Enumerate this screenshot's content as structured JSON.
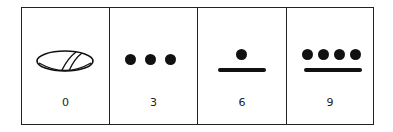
{
  "cells": [
    {
      "value": "0",
      "glyph": "shell-icon"
    },
    {
      "value": "3",
      "glyph": "three-dots",
      "dots": 3,
      "bars": 0
    },
    {
      "value": "6",
      "glyph": "one-dot-one-bar",
      "dots": 1,
      "bars": 1
    },
    {
      "value": "9",
      "glyph": "four-dots-one-bar",
      "dots": 4,
      "bars": 1
    }
  ]
}
